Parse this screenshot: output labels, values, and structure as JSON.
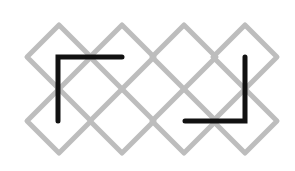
{
  "diagram": {
    "width": 295,
    "height": 171,
    "background": "#ffffff",
    "lattice": {
      "stroke_color": "#bdbdbd",
      "stroke_width": 5,
      "half_diagonal": 32,
      "columns_x": [
        59,
        122,
        184,
        245
      ],
      "rows_y": [
        57,
        121
      ]
    },
    "brackets": {
      "stroke_color": "#111111",
      "stroke_width": 5,
      "items": [
        {
          "name": "top-left-bracket",
          "points": [
            [
              58,
              121
            ],
            [
              58,
              57
            ],
            [
              122,
              57
            ]
          ]
        },
        {
          "name": "bottom-right-bracket",
          "points": [
            [
              245,
              57
            ],
            [
              245,
              121
            ],
            [
              185,
              121
            ]
          ]
        }
      ]
    }
  }
}
